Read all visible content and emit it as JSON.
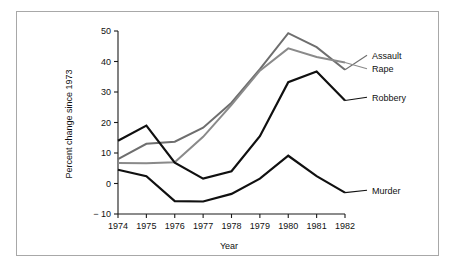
{
  "figure": {
    "background_color": "#ffffff",
    "frame_color": "#a8a8a8"
  },
  "chart_data": {
    "type": "line",
    "title": "",
    "subtitle": "",
    "xlabel": "Year",
    "ylabel": "Percent change since 1973",
    "categories": [
      1974,
      1975,
      1976,
      1977,
      1978,
      1979,
      1980,
      1981,
      1982
    ],
    "tick_labels_x": [
      "1974",
      "1975",
      "1976",
      "1977",
      "1978",
      "1979",
      "1980",
      "1981",
      "1982"
    ],
    "tick_labels_y": [
      "− 10",
      "0",
      "10",
      "20",
      "30",
      "40",
      "50"
    ],
    "xlim": [
      1974,
      1982
    ],
    "ylim": [
      -10,
      50
    ],
    "yticks": [
      -10,
      0,
      10,
      20,
      30,
      40,
      50
    ],
    "grid": false,
    "legend_position": "right-inline-labels",
    "series": [
      {
        "name": "Assault",
        "color": "#6e6e6e",
        "width": 2.0,
        "label": "Assault",
        "values": [
          8.0,
          13.0,
          13.7,
          18.3,
          26.5,
          37.5,
          49.3,
          44.7,
          37.3
        ]
      },
      {
        "name": "Rape",
        "color": "#8a8a8a",
        "width": 2.0,
        "label": "Rape",
        "values": [
          6.7,
          6.6,
          7.0,
          15.3,
          25.8,
          37.0,
          44.3,
          41.5,
          39.7
        ]
      },
      {
        "name": "Robbery",
        "color": "#101010",
        "width": 2.2,
        "label": "Robbery",
        "values": [
          14.0,
          19.0,
          6.8,
          1.6,
          4.0,
          15.5,
          33.2,
          36.7,
          27.2
        ]
      },
      {
        "name": "Murder",
        "color": "#101010",
        "width": 2.2,
        "label": "Murder",
        "values": [
          4.5,
          2.4,
          -5.8,
          -5.9,
          -3.4,
          1.6,
          9.1,
          2.4,
          -3.0
        ]
      }
    ]
  }
}
